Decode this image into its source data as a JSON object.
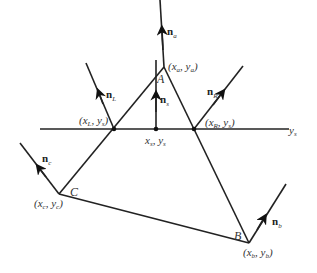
{
  "diagram": {
    "points": {
      "A": {
        "label": "A",
        "coord_label": "(x_a, y_a)",
        "x": 164,
        "y": 67
      },
      "B": {
        "label": "B",
        "coord_label": "(x_b, y_b)",
        "x": 249,
        "y": 243
      },
      "C": {
        "label": "C",
        "coord_label": "(x_c, y_c)",
        "x": 59,
        "y": 194
      },
      "L": {
        "coord_label": "(x_L, y_s)",
        "x": 114,
        "y": 129
      },
      "R": {
        "coord_label": "(x_R, y_s)",
        "x": 194,
        "y": 129
      },
      "S": {
        "coord_label": "x_s, y_s",
        "x": 156,
        "y": 129
      }
    },
    "line_label": "y_s",
    "normals": {
      "n_a": "n_a",
      "n_L": "n_L",
      "n_R": "n_R",
      "n_s": "n_s",
      "n_c": "n_c",
      "n_b": "n_b"
    },
    "text": {
      "A": "A",
      "B": "B",
      "C": "C",
      "xa": "x",
      "xa_sub": "a",
      "ya": "y",
      "ya_sub": "a",
      "xb": "x",
      "xb_sub": "b",
      "yb": "y",
      "yb_sub": "b",
      "xc": "x",
      "xc_sub": "c",
      "yc": "y",
      "yc_sub": "c",
      "xL": "x",
      "xL_sub": "L",
      "yL": "y",
      "yL_sub": "s",
      "xR": "x",
      "xR_sub": "R",
      "yR": "y",
      "yR_sub": "s",
      "xs": "x",
      "xs_sub": "s",
      "ys2": "y",
      "ys2_sub": "s",
      "ys": "y",
      "ys_sub": "s",
      "n": "n",
      "na_sub": "a",
      "nL_sub": "L",
      "nR_sub": "R",
      "ns_sub": "s",
      "nc_sub": "c",
      "nb_sub": "b"
    }
  }
}
